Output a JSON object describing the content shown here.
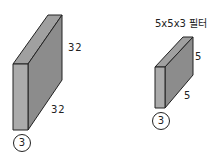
{
  "input_volume": {
    "height_label": "32",
    "width_label": "32",
    "depth_label": "3"
  },
  "filter": {
    "title": "5x5x3 필터",
    "height_label": "5",
    "width_label": "5",
    "depth_label": "3"
  },
  "colors": {
    "front_face": "#a8a8a8",
    "top_face": "#9a9a9a",
    "side_face": "#8a8a8a",
    "stroke": "#222222"
  }
}
